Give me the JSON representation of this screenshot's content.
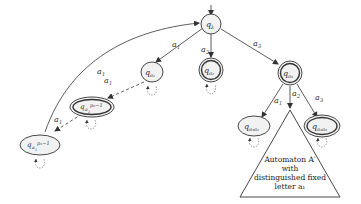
{
  "diagram": {
    "type": "automaton",
    "colors": {
      "stroke": "#333333",
      "fill": "#f2f2f2",
      "background": "#ffffff"
    },
    "states": [
      {
        "id": "q_lambda",
        "label": "q",
        "sub": "λ",
        "accepting": false,
        "initial": true
      },
      {
        "id": "q_a1",
        "label": "q",
        "sub": "a₁",
        "accepting": false
      },
      {
        "id": "q_a2",
        "label": "q",
        "sub": "a₂",
        "accepting": true
      },
      {
        "id": "q_a3",
        "label": "q",
        "sub": "a₃",
        "accepting": true
      },
      {
        "id": "q_a1_p2minus1",
        "label": "q",
        "sub": "a₁",
        "sup": "p₂−1",
        "accepting": true
      },
      {
        "id": "q_a1_p1minus1",
        "label": "q",
        "sub": "a₁",
        "sup": "p₁−1",
        "accepting": false
      },
      {
        "id": "q_a3a1",
        "label": "q",
        "sub": "a₃a₁",
        "accepting": false
      },
      {
        "id": "q_a3a3",
        "label": "q",
        "sub": "a₃a₃",
        "accepting": true
      }
    ],
    "edges": [
      {
        "from": "q_lambda",
        "to": "q_a1",
        "label": "a₁",
        "style": "solid"
      },
      {
        "from": "q_lambda",
        "to": "q_a2",
        "label": "a₂",
        "style": "solid"
      },
      {
        "from": "q_lambda",
        "to": "q_a3",
        "label": "a₃",
        "style": "solid"
      },
      {
        "from": "q_a1",
        "to": "q_a1_p2minus1",
        "label": "a₁",
        "style": "dashed"
      },
      {
        "from": "q_a1_p2minus1",
        "to": "q_a1_p1minus1",
        "label": "a₁",
        "style": "dashed"
      },
      {
        "from": "q_a1_p1minus1",
        "to": "q_lambda",
        "label": "a₁",
        "style": "solid-curved"
      },
      {
        "from": "q_a3",
        "to": "q_a3a1",
        "label": "a₁",
        "style": "solid"
      },
      {
        "from": "q_a3",
        "to": "triangle",
        "label": "a₂",
        "style": "solid"
      },
      {
        "from": "q_a3",
        "to": "q_a3a3",
        "label": "a₃",
        "style": "solid"
      }
    ],
    "edge_labels": {
      "lambda_a1": "a",
      "lambda_a2": "a",
      "lambda_a3": "a",
      "a3_a1": "a",
      "a3_a2": "a",
      "a3_a3": "a",
      "dash1": "a",
      "dash2": "a",
      "back": "a",
      "sub1": "1",
      "sub2": "2",
      "sub3": "3"
    },
    "node_labels": {
      "q": "q",
      "lambda": "λ",
      "a1": "a₁",
      "a2": "a₂",
      "a3": "a₃",
      "a3a1": "a₃a₁",
      "a3a3": "a₃a₃",
      "a1_base": "a",
      "a1_sub": "1",
      "p2m1": "p₂−1",
      "p1m1": "p₁−1"
    },
    "triangle": {
      "line1": "Automaton A′",
      "line2": "with",
      "line3": "distinguished fixed",
      "line4": "letter a₁"
    }
  }
}
